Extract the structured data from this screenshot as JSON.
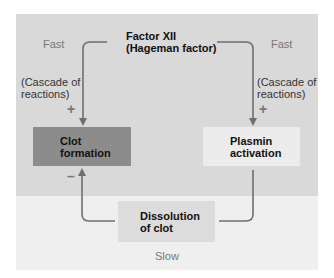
{
  "diagram": {
    "top_node": {
      "line1": "Factor XII",
      "line2": "(Hageman factor)"
    },
    "left_speed": "Fast",
    "right_speed": "Fast",
    "bottom_speed": "Slow",
    "left_note": {
      "line1": "(Cascade of",
      "line2": "reactions)"
    },
    "right_note": {
      "line1": "(Cascade of",
      "line2": "reactions)"
    },
    "left_sign": "+",
    "right_sign": "+",
    "inhibit_sign": "–",
    "nodes": {
      "clot": {
        "line1": "Clot",
        "line2": "formation"
      },
      "plasmin": {
        "line1": "Plasmin",
        "line2": "activation"
      },
      "dissolution": {
        "line1": "Dissolution",
        "line2": "of clot"
      }
    },
    "colors": {
      "top_region": "#d9d9d9",
      "bottom_region": "#efefef",
      "clot_box": "#8c8c8c",
      "plasmin_box": "#ececec",
      "dissolution_box": "#dcdcdc",
      "arrow": "#6f6f6f"
    }
  }
}
